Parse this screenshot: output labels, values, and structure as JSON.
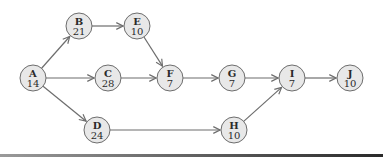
{
  "diagram": {
    "type": "activity-network",
    "nodes": [
      {
        "id": "A",
        "label": "A",
        "value": "14",
        "x": 33,
        "y": 78
      },
      {
        "id": "B",
        "label": "B",
        "value": "21",
        "x": 79,
        "y": 26
      },
      {
        "id": "C",
        "label": "C",
        "value": "28",
        "x": 108,
        "y": 78
      },
      {
        "id": "D",
        "label": "D",
        "value": "24",
        "x": 97,
        "y": 130
      },
      {
        "id": "E",
        "label": "E",
        "value": "10",
        "x": 137,
        "y": 26
      },
      {
        "id": "F",
        "label": "F",
        "value": "7",
        "x": 170,
        "y": 78
      },
      {
        "id": "G",
        "label": "G",
        "value": "7",
        "x": 232,
        "y": 78
      },
      {
        "id": "H",
        "label": "H",
        "value": "10",
        "x": 234,
        "y": 130
      },
      {
        "id": "I",
        "label": "I",
        "value": "7",
        "x": 292,
        "y": 78
      },
      {
        "id": "J",
        "label": "J",
        "value": "10",
        "x": 350,
        "y": 78
      }
    ],
    "edges": [
      {
        "from": "A",
        "to": "B"
      },
      {
        "from": "A",
        "to": "C"
      },
      {
        "from": "A",
        "to": "D"
      },
      {
        "from": "B",
        "to": "E"
      },
      {
        "from": "E",
        "to": "F"
      },
      {
        "from": "C",
        "to": "F"
      },
      {
        "from": "F",
        "to": "G"
      },
      {
        "from": "G",
        "to": "I"
      },
      {
        "from": "D",
        "to": "H"
      },
      {
        "from": "H",
        "to": "I"
      },
      {
        "from": "I",
        "to": "J"
      }
    ],
    "node_radius": 13,
    "colors": {
      "node_fill": "#e8e8e8",
      "stroke": "#6d6d6d",
      "text": "#2a2a2a"
    }
  }
}
